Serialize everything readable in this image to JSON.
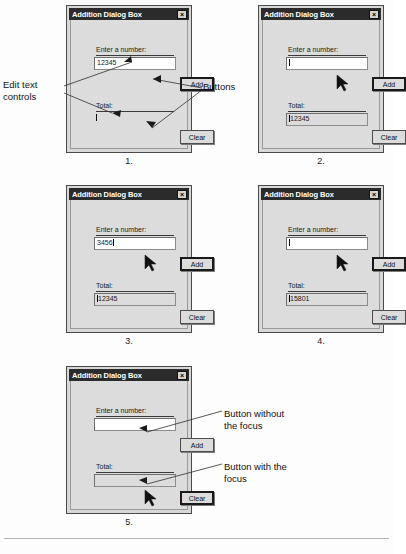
{
  "figure": {
    "dialog_title": "Addition Dialog Box",
    "close_label": "×",
    "number_label": "Enter a number:",
    "total_label": "Total:",
    "add_label": "Add",
    "clear_label": "Clear"
  },
  "panels": [
    {
      "caption": "1.",
      "number_value": "12345",
      "total_value": "",
      "number_caret": false,
      "total_caret": true,
      "add_focused": true,
      "clear_focused": false,
      "total_shaded": false,
      "cursor": false
    },
    {
      "caption": "2.",
      "number_value": "",
      "total_value": "12345",
      "number_caret": true,
      "total_caret": true,
      "add_focused": true,
      "clear_focused": false,
      "total_shaded": true,
      "cursor": true
    },
    {
      "caption": "3.",
      "number_value": "3456",
      "total_value": "12345",
      "number_caret": true,
      "total_caret": true,
      "add_focused": true,
      "clear_focused": false,
      "total_shaded": true,
      "cursor": true
    },
    {
      "caption": "4.",
      "number_value": "",
      "total_value": "15801",
      "number_caret": true,
      "total_caret": true,
      "add_focused": true,
      "clear_focused": false,
      "total_shaded": true,
      "cursor": true
    },
    {
      "caption": "5.",
      "number_value": "",
      "total_value": "",
      "number_caret": false,
      "total_caret": false,
      "add_focused": false,
      "clear_focused": true,
      "total_shaded": false,
      "cursor": true
    }
  ],
  "annotations": {
    "edit_text_controls": "Edit text\ncontrols",
    "buttons": "Buttons",
    "button_without_focus": "Button without\nthe focus",
    "button_with_focus": "Button with the\nfocus"
  },
  "colors": {
    "titlebar": "#2b2b2b",
    "dialog_face": "#dcdcdc",
    "edit_background": "#ffffff",
    "text": "#1a1a1a"
  }
}
